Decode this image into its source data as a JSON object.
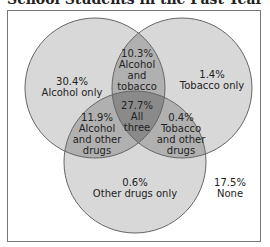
{
  "title": "School Students in the Past Year",
  "colors": {
    "single": "#d8d8d8",
    "double": "#b0b0b0",
    "triple": "#8a8a8a",
    "stroke": "#666666"
  },
  "regions": {
    "alcohol_only": {
      "pct": "30.4%",
      "label": "Alcohol only"
    },
    "tobacco_only": {
      "pct": "1.4%",
      "label": "Tobacco only"
    },
    "alcohol_tobacco": {
      "pct": "10.3%",
      "line1": "Alcohol",
      "line2": "and",
      "line3": "tobacco"
    },
    "all_three": {
      "pct": "27.7%",
      "line1": "All",
      "line2": "three"
    },
    "alcohol_other": {
      "pct": "11.9%",
      "line1": "Alcohol",
      "line2": "and other",
      "line3": "drugs"
    },
    "tobacco_other": {
      "pct": "0.4%",
      "line1": "Tobacco",
      "line2": "and other",
      "line3": "drugs"
    },
    "other_only": {
      "pct": "0.6%",
      "label": "Other drugs only"
    },
    "none": {
      "pct": "17.5%",
      "label": "None"
    }
  },
  "sets": [
    "Alcohol",
    "Tobacco",
    "Other drugs"
  ]
}
